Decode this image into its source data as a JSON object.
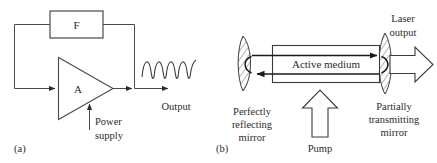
{
  "figure": {
    "background_color": "#ffffff",
    "line_color": "#3a3a3a",
    "text_color": "#2b2b2b"
  },
  "panel_a": {
    "caption": "(a)",
    "amplifier_label": "A",
    "feedback_label": "F",
    "power_supply_label_line1": "Power",
    "power_supply_label_line2": "supply",
    "output_label": "Output",
    "waveform": {
      "cycles": 4,
      "description": "sinusoidal output waveform"
    }
  },
  "panel_b": {
    "caption": "(b)",
    "active_medium_label": "Active medium",
    "pump_label": "Pump",
    "laser_output_line1": "Laser",
    "laser_output_line2": "output",
    "left_mirror_line1": "Perfectly",
    "left_mirror_line2": "reflecting",
    "left_mirror_line3": "mirror",
    "right_mirror_line1": "Partially",
    "right_mirror_line2": "transmitting",
    "right_mirror_line3": "mirror"
  }
}
